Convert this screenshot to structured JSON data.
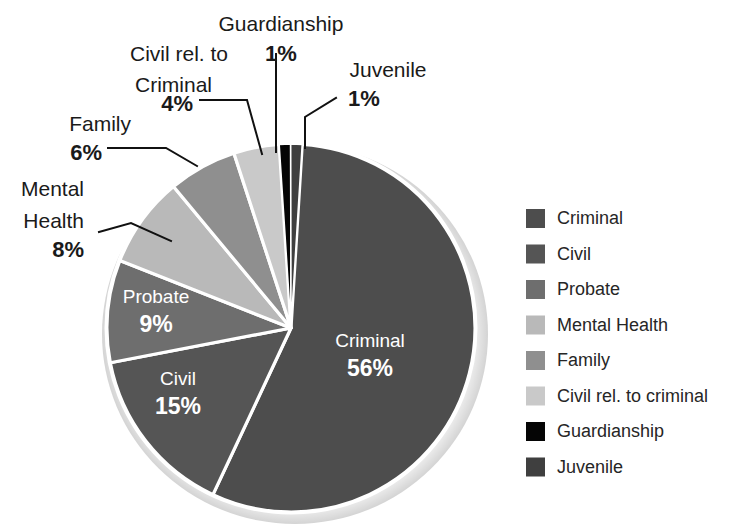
{
  "chart_data": {
    "type": "pie",
    "title": "",
    "categories": [
      "Criminal",
      "Civil",
      "Probate",
      "Mental Health",
      "Family",
      "Civil rel. to criminal",
      "Guardianship",
      "Juvenile"
    ],
    "values": [
      56,
      15,
      9,
      8,
      6,
      4,
      1,
      1
    ],
    "value_unit": "%",
    "legend_position": "right",
    "grid": false,
    "colors": [
      "#4d4d4d",
      "#555555",
      "#6e6e6e",
      "#b9b9b9",
      "#8f8f8f",
      "#c9c9c9",
      "#050505",
      "#3f3f3f"
    ],
    "slice_separator_color": "#ffffff"
  },
  "slices": [
    {
      "id": "criminal",
      "label": "Criminal",
      "percent": "56%",
      "value": 56,
      "color": "#4d4d4d",
      "label_placement": "inside",
      "label_color": "#ffffff"
    },
    {
      "id": "civil",
      "label": "Civil",
      "percent": "15%",
      "value": 15,
      "color": "#555555",
      "label_placement": "inside",
      "label_color": "#ffffff"
    },
    {
      "id": "probate",
      "label": "Probate",
      "percent": "9%",
      "value": 9,
      "color": "#6e6e6e",
      "label_placement": "inside",
      "label_color": "#ffffff"
    },
    {
      "id": "mental-health",
      "label": "Mental Health",
      "percent": "8%",
      "value": 8,
      "color": "#b9b9b9",
      "label_placement": "outside",
      "label_color": "#1a1a1a"
    },
    {
      "id": "family",
      "label": "Family",
      "percent": "6%",
      "value": 6,
      "color": "#8f8f8f",
      "label_placement": "outside",
      "label_color": "#1a1a1a"
    },
    {
      "id": "civil-rel",
      "label": "Civil rel. to criminal",
      "percent": "4%",
      "value": 4,
      "color": "#c9c9c9",
      "label_placement": "outside",
      "label_color": "#1a1a1a"
    },
    {
      "id": "guardianship",
      "label": "Guardianship",
      "percent": "1%",
      "value": 1,
      "color": "#050505",
      "label_placement": "outside",
      "label_color": "#1a1a1a"
    },
    {
      "id": "juvenile",
      "label": "Juvenile",
      "percent": "1%",
      "value": 1,
      "color": "#3f3f3f",
      "label_placement": "outside",
      "label_color": "#1a1a1a"
    }
  ],
  "inside_labels": {
    "criminal": {
      "name": "Criminal",
      "percent": "56%"
    },
    "civil": {
      "name": "Civil",
      "percent": "15%"
    },
    "probate": {
      "name": "Probate",
      "percent": "9%"
    }
  },
  "callouts": {
    "mental_health": {
      "line1": "Mental",
      "line2": "Health",
      "percent": "8%"
    },
    "family": {
      "line1": "Family",
      "line2": "",
      "percent": "6%"
    },
    "civil_rel": {
      "line1": "Civil rel. to",
      "line2": "Criminal",
      "percent": "4%"
    },
    "guardianship": {
      "line1": "Guardianship",
      "line2": "",
      "percent": "1%"
    },
    "juvenile": {
      "line1": "Juvenile",
      "line2": "",
      "percent": "1%"
    }
  },
  "legend": {
    "items": [
      {
        "label": "Criminal",
        "color": "#4d4d4d"
      },
      {
        "label": "Civil",
        "color": "#555555"
      },
      {
        "label": "Probate",
        "color": "#6e6e6e"
      },
      {
        "label": "Mental Health",
        "color": "#b9b9b9"
      },
      {
        "label": "Family",
        "color": "#8f8f8f"
      },
      {
        "label": "Civil rel. to criminal",
        "color": "#c9c9c9"
      },
      {
        "label": "Guardianship",
        "color": "#050505"
      },
      {
        "label": "Juvenile",
        "color": "#3f3f3f"
      }
    ]
  }
}
